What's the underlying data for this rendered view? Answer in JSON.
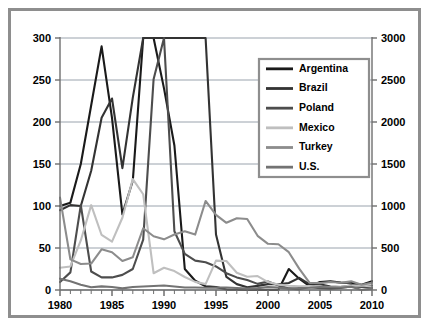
{
  "chart_data": {
    "type": "line",
    "title": "",
    "xlabel": "",
    "ylabel": "",
    "xlim": [
      1980,
      2010
    ],
    "ylim": [
      0,
      300
    ],
    "y2lim": [
      0,
      3000
    ],
    "grid": true,
    "legend_position": "top-right",
    "x_ticks": [
      "1980",
      "1985",
      "1990",
      "1995",
      "2000",
      "2005",
      "2010"
    ],
    "x_tick_values": [
      1980,
      1985,
      1990,
      1995,
      2000,
      2005,
      2010
    ],
    "x_minor_tick_step": 1,
    "y_ticks": [
      "0",
      "50",
      "100",
      "150",
      "200",
      "250",
      "300"
    ],
    "y_tick_values": [
      0,
      50,
      100,
      150,
      200,
      250,
      300
    ],
    "y2_ticks": [
      "0",
      "500",
      "1000",
      "1500",
      "2000",
      "2500",
      "3000"
    ],
    "y2_tick_values": [
      0,
      500,
      1000,
      1500,
      2000,
      2500,
      3000
    ],
    "x": [
      1980,
      1981,
      1982,
      1983,
      1984,
      1985,
      1986,
      1987,
      1988,
      1989,
      1990,
      1991,
      1992,
      1993,
      1994,
      1995,
      1996,
      1997,
      1998,
      1999,
      2000,
      2001,
      2002,
      2003,
      2004,
      2005,
      2006,
      2007,
      2008,
      2009,
      2010
    ],
    "series": [
      {
        "name": "Argentina",
        "color": "#1a1a1a",
        "axis": "right",
        "values": [
          1000,
          1040,
          1500,
          2200,
          2900,
          2050,
          900,
          1300,
          3450,
          30000,
          2400,
          1720,
          250,
          110,
          45,
          35,
          5,
          3,
          2,
          -1,
          -1,
          -5,
          250,
          135,
          45,
          95,
          105,
          88,
          86,
          62,
          105
        ]
      },
      {
        "name": "Brazil",
        "color": "#333333",
        "axis": "right",
        "values": [
          950,
          1010,
          1000,
          1420,
          2050,
          2280,
          1450,
          2290,
          6820,
          12900,
          29500,
          4750,
          9930,
          19270,
          20760,
          660,
          155,
          70,
          33,
          49,
          70,
          68,
          83,
          145,
          66,
          69,
          42,
          36,
          57,
          49,
          50
        ]
      },
      {
        "name": "Poland",
        "color": "#4d4d4d",
        "axis": "right",
        "values": [
          95,
          210,
          1010,
          220,
          150,
          150,
          180,
          250,
          600,
          2510,
          5860,
          700,
          430,
          350,
          330,
          280,
          200,
          150,
          118,
          73,
          102,
          55,
          19,
          8,
          35,
          21,
          13,
          25,
          42,
          35,
          27
        ]
      },
      {
        "name": "Mexico",
        "color": "#bfbfbf",
        "axis": "right",
        "values": [
          265,
          280,
          590,
          1010,
          655,
          575,
          860,
          1320,
          1140,
          200,
          265,
          225,
          155,
          97,
          70,
          350,
          345,
          205,
          157,
          166,
          94,
          64,
          50,
          45,
          47,
          40,
          36,
          40,
          51,
          53,
          42
        ]
      },
      {
        "name": "Turkey",
        "color": "#8c8c8c",
        "axis": "right",
        "values": [
          1100,
          365,
          310,
          315,
          485,
          450,
          345,
          390,
          735,
          640,
          603,
          660,
          700,
          660,
          1060,
          895,
          800,
          855,
          845,
          645,
          550,
          545,
          450,
          255,
          86,
          82,
          96,
          86,
          103,
          63,
          86
        ]
      },
      {
        "name": "U.S.",
        "color": "#737373",
        "axis": "right",
        "values": [
          135,
          103,
          62,
          32,
          43,
          36,
          19,
          36,
          41,
          48,
          54,
          42,
          30,
          30,
          26,
          28,
          29,
          23,
          16,
          22,
          34,
          28,
          16,
          23,
          27,
          34,
          32,
          29,
          38,
          -4,
          16
        ]
      }
    ],
    "annotations": []
  },
  "legend": {
    "items": [
      {
        "label": "Argentina"
      },
      {
        "label": "Brazil"
      },
      {
        "label": "Poland"
      },
      {
        "label": "Mexico"
      },
      {
        "label": "Turkey"
      },
      {
        "label": "U.S."
      }
    ]
  },
  "style": {
    "frame_color": "#8e8e8e",
    "grid_color": "#9aa3ad",
    "axis_color": "#6f6f6f",
    "background": "#ffffff",
    "text_color": "#000000"
  }
}
